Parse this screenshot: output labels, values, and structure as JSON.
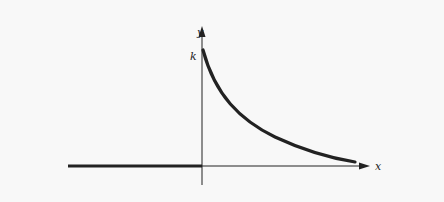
{
  "figure": {
    "axes": {
      "x_label": "x",
      "y_label": "y"
    },
    "annotations": {
      "y_intercept_label": "k"
    },
    "colors": {
      "background": "#f8f8f8",
      "axis": "#222222",
      "curve": "#222222"
    }
  }
}
